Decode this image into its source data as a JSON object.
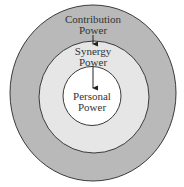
{
  "diagram": {
    "type": "concentric-circles",
    "rings": [
      {
        "id": "outer",
        "line1": "Contribution",
        "line2": "Power",
        "fill": "#b9b9b9"
      },
      {
        "id": "middle",
        "line1": "Synergy",
        "line2": "Power",
        "fill": "#e6e6e6"
      },
      {
        "id": "inner",
        "line1": "Personal",
        "line2": "Power",
        "fill": "#ffffff"
      }
    ],
    "arrows": [
      {
        "from": "outer",
        "to": "middle"
      },
      {
        "from": "middle",
        "to": "inner"
      }
    ],
    "stroke": "#3a3a3a"
  }
}
